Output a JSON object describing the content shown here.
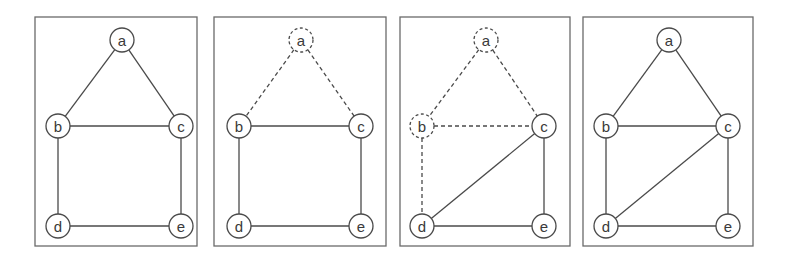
{
  "figure": {
    "node_radius": 12,
    "panels": [
      {
        "frame": {
          "x": 35,
          "y": 17,
          "w": 162,
          "h": 229
        },
        "nodes": [
          {
            "id": "a",
            "label": "a",
            "x": 122,
            "y": 40,
            "dashed": false
          },
          {
            "id": "b",
            "label": "b",
            "x": 58,
            "y": 126,
            "dashed": false
          },
          {
            "id": "c",
            "label": "c",
            "x": 181,
            "y": 126,
            "dashed": false
          },
          {
            "id": "d",
            "label": "d",
            "x": 58,
            "y": 226,
            "dashed": false
          },
          {
            "id": "e",
            "label": "e",
            "x": 181,
            "y": 226,
            "dashed": false
          }
        ],
        "edges": [
          {
            "from": "a",
            "to": "b",
            "dashed": false
          },
          {
            "from": "a",
            "to": "c",
            "dashed": false
          },
          {
            "from": "b",
            "to": "c",
            "dashed": false
          },
          {
            "from": "b",
            "to": "d",
            "dashed": false
          },
          {
            "from": "c",
            "to": "e",
            "dashed": false
          },
          {
            "from": "d",
            "to": "e",
            "dashed": false
          }
        ]
      },
      {
        "frame": {
          "x": 214,
          "y": 17,
          "w": 172,
          "h": 229
        },
        "nodes": [
          {
            "id": "a",
            "label": "a",
            "x": 301,
            "y": 40,
            "dashed": true
          },
          {
            "id": "b",
            "label": "b",
            "x": 239,
            "y": 126,
            "dashed": false
          },
          {
            "id": "c",
            "label": "c",
            "x": 361,
            "y": 126,
            "dashed": false
          },
          {
            "id": "d",
            "label": "d",
            "x": 239,
            "y": 226,
            "dashed": false
          },
          {
            "id": "e",
            "label": "e",
            "x": 361,
            "y": 226,
            "dashed": false
          }
        ],
        "edges": [
          {
            "from": "a",
            "to": "b",
            "dashed": true
          },
          {
            "from": "a",
            "to": "c",
            "dashed": true
          },
          {
            "from": "b",
            "to": "c",
            "dashed": false
          },
          {
            "from": "b",
            "to": "d",
            "dashed": false
          },
          {
            "from": "c",
            "to": "e",
            "dashed": false
          },
          {
            "from": "d",
            "to": "e",
            "dashed": false
          }
        ]
      },
      {
        "frame": {
          "x": 400,
          "y": 17,
          "w": 170,
          "h": 229
        },
        "nodes": [
          {
            "id": "a",
            "label": "a",
            "x": 486,
            "y": 40,
            "dashed": true
          },
          {
            "id": "b",
            "label": "b",
            "x": 422,
            "y": 126,
            "dashed": true
          },
          {
            "id": "c",
            "label": "c",
            "x": 544,
            "y": 126,
            "dashed": false
          },
          {
            "id": "d",
            "label": "d",
            "x": 422,
            "y": 226,
            "dashed": false
          },
          {
            "id": "e",
            "label": "e",
            "x": 544,
            "y": 226,
            "dashed": false
          }
        ],
        "edges": [
          {
            "from": "a",
            "to": "b",
            "dashed": true
          },
          {
            "from": "a",
            "to": "c",
            "dashed": true
          },
          {
            "from": "b",
            "to": "c",
            "dashed": true
          },
          {
            "from": "b",
            "to": "d",
            "dashed": true
          },
          {
            "from": "c",
            "to": "d",
            "dashed": false
          },
          {
            "from": "c",
            "to": "e",
            "dashed": false
          },
          {
            "from": "d",
            "to": "e",
            "dashed": false
          }
        ]
      },
      {
        "frame": {
          "x": 583,
          "y": 17,
          "w": 170,
          "h": 229
        },
        "nodes": [
          {
            "id": "a",
            "label": "a",
            "x": 669,
            "y": 40,
            "dashed": false
          },
          {
            "id": "b",
            "label": "b",
            "x": 606,
            "y": 126,
            "dashed": false
          },
          {
            "id": "c",
            "label": "c",
            "x": 728,
            "y": 126,
            "dashed": false
          },
          {
            "id": "d",
            "label": "d",
            "x": 606,
            "y": 226,
            "dashed": false
          },
          {
            "id": "e",
            "label": "e",
            "x": 728,
            "y": 226,
            "dashed": false
          }
        ],
        "edges": [
          {
            "from": "a",
            "to": "b",
            "dashed": false
          },
          {
            "from": "a",
            "to": "c",
            "dashed": false
          },
          {
            "from": "b",
            "to": "c",
            "dashed": false
          },
          {
            "from": "b",
            "to": "d",
            "dashed": false
          },
          {
            "from": "c",
            "to": "d",
            "dashed": false
          },
          {
            "from": "c",
            "to": "e",
            "dashed": false
          },
          {
            "from": "d",
            "to": "e",
            "dashed": false
          }
        ]
      }
    ]
  }
}
